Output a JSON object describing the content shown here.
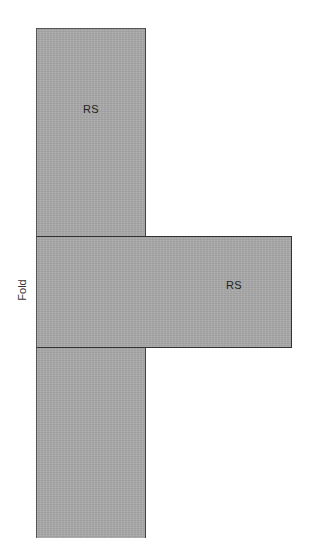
{
  "diagram": {
    "type": "sewing-pattern-layout",
    "fill_color": "#a9a9a9",
    "border_color": "#444444",
    "panels": [
      {
        "id": "top",
        "label": "RS",
        "x": 36,
        "y": 28,
        "width": 110,
        "height": 209
      },
      {
        "id": "middle",
        "label": "RS",
        "x": 36,
        "y": 236,
        "width": 256,
        "height": 112
      },
      {
        "id": "bottom",
        "label": "",
        "x": 36,
        "y": 347,
        "width": 110,
        "height": 191
      }
    ],
    "fold_label": "Fold"
  }
}
